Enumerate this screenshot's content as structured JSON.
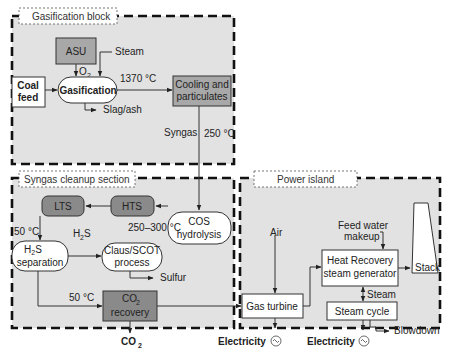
{
  "sections": {
    "gasification": "Gasification block",
    "cleanup": "Syngas cleanup section",
    "power": "Power island"
  },
  "nodes": {
    "asu": "ASU",
    "coal_feed_1": "Coal",
    "coal_feed_2": "feed",
    "gasification": "Gasification",
    "cooling_1": "Cooling and",
    "cooling_2": "particulates",
    "cos_1": "COS",
    "cos_2": "hydrolysis",
    "hts": "HTS",
    "lts": "LTS",
    "h2s_sep_1": "H",
    "h2s_sep_sub": "2",
    "h2s_sep_1b": "S",
    "h2s_sep_2": "separation",
    "claus_1": "Claus/SCOT",
    "claus_2": "process",
    "co2_rec_1": "CO",
    "co2_rec_sub": "2",
    "co2_rec_2": "recovery",
    "gas_turbine": "Gas turbine",
    "hrsg_1": "Heat Recovery",
    "hrsg_2": "steam generator",
    "steam_cycle": "Steam cycle",
    "stack": "Stack"
  },
  "labels": {
    "steam_in": "Steam",
    "o2": "O",
    "o2_sub": "2",
    "temp_1370": "1370 °C",
    "slag": "Slag/ash",
    "syngas": "Syngas",
    "temp_250": "250 °C",
    "temp_250_300": "250–300 °C",
    "temp_50_a": "50 °C",
    "h2s": "H",
    "h2s_sub": "2",
    "h2s_s": "S",
    "sulfur": "Sulfur",
    "temp_50_b": "50 °C",
    "co2_out": "CO",
    "co2_out_sub": "2",
    "air": "Air",
    "feed_water_1": "Feed water",
    "feed_water_2": "makeup",
    "steam_hrsg": "Steam",
    "blowdown": "Blowdown",
    "electricity_1": "Electricity",
    "electricity_2": "Electricity"
  },
  "colors": {
    "section_fill": "#e2e2e2",
    "dark_node": "#8a8a8a",
    "mid_node": "#a8a8a8",
    "white_node": "#ffffff"
  }
}
